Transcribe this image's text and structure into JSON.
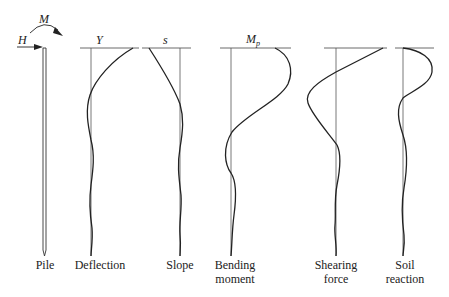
{
  "diagram": {
    "load_symbols": {
      "horizontal_force": "H",
      "moment": "M"
    },
    "panels": [
      {
        "id": "pile",
        "label_line1": "Pile",
        "label_line2": "",
        "top_symbol": ""
      },
      {
        "id": "deflection",
        "label_line1": "Deflection",
        "label_line2": "",
        "top_symbol": "Y"
      },
      {
        "id": "slope",
        "label_line1": "Slope",
        "label_line2": "",
        "top_symbol": "s"
      },
      {
        "id": "bending-moment",
        "label_line1": "Bending",
        "label_line2": "moment",
        "top_symbol": "M",
        "top_symbol_sub": "p"
      },
      {
        "id": "shearing-force",
        "label_line1": "Shearing",
        "label_line2": "force",
        "top_symbol": ""
      },
      {
        "id": "soil-reaction",
        "label_line1": "Soil",
        "label_line2": "reaction",
        "top_symbol": ""
      }
    ],
    "colors": {
      "line": "#222222",
      "axis": "#555555",
      "background": "#ffffff"
    }
  }
}
